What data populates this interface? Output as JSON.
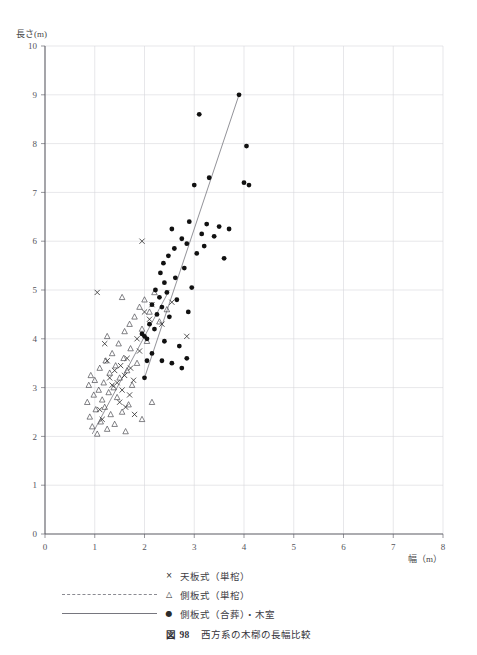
{
  "page_header": "",
  "caption": {
    "number": "図 98",
    "text": "西方系の木槨の長幅比較"
  },
  "legend": [
    {
      "symbol": "×",
      "line": "none",
      "label": "天板式（単棺）"
    },
    {
      "symbol": "△",
      "line": "dashed",
      "label": "側板式（単棺）"
    },
    {
      "symbol": "●",
      "line": "solid",
      "label": "側板式（合葬）・木室"
    }
  ],
  "chart_data": {
    "type": "scatter",
    "title": "西方系の木槨の長幅比較",
    "xlabel": "幅（m）",
    "ylabel": "長さ(m)",
    "xlim": [
      0,
      8
    ],
    "ylim": [
      0,
      10
    ],
    "xticks": [
      0,
      1,
      2,
      3,
      4,
      5,
      6,
      7,
      8
    ],
    "yticks": [
      0,
      1,
      2,
      3,
      4,
      5,
      6,
      7,
      8,
      9,
      10
    ],
    "grid": true,
    "legend_position": "below",
    "series": [
      {
        "name": "天板式（単棺）",
        "marker": "x",
        "color": "#2b2b2b",
        "points": [
          [
            1.05,
            4.95
          ],
          [
            1.2,
            3.9
          ],
          [
            1.25,
            3.55
          ],
          [
            1.3,
            3.2
          ],
          [
            1.35,
            3.05
          ],
          [
            1.4,
            3.35
          ],
          [
            1.45,
            3.1
          ],
          [
            1.5,
            2.7
          ],
          [
            1.52,
            3.45
          ],
          [
            1.55,
            2.95
          ],
          [
            1.6,
            3.25
          ],
          [
            1.62,
            2.6
          ],
          [
            1.65,
            3.6
          ],
          [
            1.7,
            2.85
          ],
          [
            1.72,
            3.4
          ],
          [
            1.78,
            3.15
          ],
          [
            1.8,
            2.45
          ],
          [
            1.85,
            4.0
          ],
          [
            1.9,
            3.75
          ],
          [
            1.95,
            6.0
          ],
          [
            2.0,
            4.55
          ],
          [
            2.1,
            4.4
          ],
          [
            2.15,
            4.7
          ],
          [
            2.35,
            4.3
          ],
          [
            2.55,
            4.75
          ],
          [
            2.85,
            4.05
          ],
          [
            1.15,
            2.35
          ],
          [
            1.1,
            2.55
          ]
        ]
      },
      {
        "name": "側板式（単棺）",
        "marker": "triangle",
        "color": "#404046",
        "points": [
          [
            0.85,
            2.7
          ],
          [
            0.88,
            3.05
          ],
          [
            0.9,
            2.4
          ],
          [
            0.92,
            3.25
          ],
          [
            0.95,
            2.2
          ],
          [
            0.98,
            2.85
          ],
          [
            1.0,
            3.15
          ],
          [
            1.02,
            2.55
          ],
          [
            1.05,
            2.05
          ],
          [
            1.08,
            2.95
          ],
          [
            1.1,
            3.4
          ],
          [
            1.12,
            2.3
          ],
          [
            1.15,
            2.75
          ],
          [
            1.18,
            3.1
          ],
          [
            1.2,
            2.6
          ],
          [
            1.22,
            3.55
          ],
          [
            1.25,
            2.15
          ],
          [
            1.28,
            2.9
          ],
          [
            1.3,
            3.3
          ],
          [
            1.32,
            2.45
          ],
          [
            1.35,
            3.7
          ],
          [
            1.38,
            3.0
          ],
          [
            1.4,
            2.25
          ],
          [
            1.42,
            3.45
          ],
          [
            1.45,
            2.8
          ],
          [
            1.48,
            3.9
          ],
          [
            1.5,
            3.2
          ],
          [
            1.55,
            2.5
          ],
          [
            1.58,
            3.6
          ],
          [
            1.6,
            4.15
          ],
          [
            1.62,
            2.1
          ],
          [
            1.65,
            3.35
          ],
          [
            1.68,
            2.65
          ],
          [
            1.7,
            4.3
          ],
          [
            1.72,
            3.8
          ],
          [
            1.75,
            3.05
          ],
          [
            1.8,
            4.45
          ],
          [
            1.85,
            3.5
          ],
          [
            1.9,
            4.65
          ],
          [
            1.95,
            4.2
          ],
          [
            2.0,
            4.8
          ],
          [
            2.05,
            3.95
          ],
          [
            2.1,
            4.55
          ],
          [
            2.2,
            4.95
          ],
          [
            2.3,
            4.35
          ],
          [
            2.45,
            4.6
          ],
          [
            1.95,
            2.35
          ],
          [
            2.15,
            2.7
          ],
          [
            1.55,
            4.85
          ],
          [
            1.25,
            4.05
          ]
        ]
      },
      {
        "name": "側板式（合葬）・木室",
        "marker": "circle",
        "color": "#111111",
        "points": [
          [
            2.0,
            3.2
          ],
          [
            2.05,
            3.55
          ],
          [
            2.1,
            4.3
          ],
          [
            2.15,
            4.7
          ],
          [
            2.2,
            4.2
          ],
          [
            2.22,
            5.0
          ],
          [
            2.25,
            4.5
          ],
          [
            2.3,
            4.85
          ],
          [
            2.32,
            5.35
          ],
          [
            2.35,
            4.65
          ],
          [
            2.38,
            5.55
          ],
          [
            2.4,
            5.15
          ],
          [
            2.45,
            4.95
          ],
          [
            2.48,
            5.7
          ],
          [
            2.5,
            4.45
          ],
          [
            2.55,
            6.25
          ],
          [
            2.6,
            5.85
          ],
          [
            2.62,
            5.25
          ],
          [
            2.65,
            4.8
          ],
          [
            2.7,
            3.85
          ],
          [
            2.75,
            6.05
          ],
          [
            2.8,
            5.45
          ],
          [
            2.85,
            5.95
          ],
          [
            2.88,
            4.55
          ],
          [
            2.9,
            6.4
          ],
          [
            2.95,
            5.05
          ],
          [
            3.0,
            7.15
          ],
          [
            3.05,
            5.75
          ],
          [
            3.1,
            8.6
          ],
          [
            3.15,
            6.15
          ],
          [
            3.2,
            5.9
          ],
          [
            3.25,
            6.35
          ],
          [
            3.3,
            7.3
          ],
          [
            3.4,
            6.1
          ],
          [
            3.5,
            6.3
          ],
          [
            3.6,
            5.65
          ],
          [
            3.7,
            6.25
          ],
          [
            3.9,
            9.0
          ],
          [
            4.0,
            7.2
          ],
          [
            4.05,
            7.95
          ],
          [
            4.1,
            7.15
          ],
          [
            2.35,
            3.55
          ],
          [
            2.55,
            3.5
          ],
          [
            2.75,
            3.4
          ],
          [
            2.85,
            3.6
          ],
          [
            2.4,
            3.95
          ],
          [
            2.0,
            4.05
          ],
          [
            2.05,
            4.0
          ],
          [
            1.95,
            4.1
          ],
          [
            2.15,
            3.7
          ]
        ]
      }
    ],
    "fit_lines": [
      {
        "name": "側板式（単棺）",
        "style": "solid",
        "x0": 0.95,
        "y0": 2.05,
        "x1": 2.5,
        "y1": 5.0
      },
      {
        "name": "側板式（合葬）・木室",
        "style": "solid",
        "x0": 2.0,
        "y0": 3.2,
        "x1": 3.9,
        "y1": 9.0
      }
    ]
  }
}
